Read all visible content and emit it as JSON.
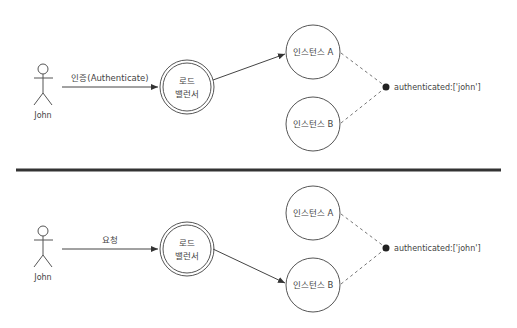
{
  "colors": {
    "stroke": "#555555",
    "text": "#444444",
    "divider": "#333333",
    "dash": "#777777",
    "dot": "#222222"
  },
  "top_panel": {
    "actor": {
      "label": "John"
    },
    "arrow_label": "인증(Authenticate)",
    "load_balancer": {
      "line1": "로드",
      "line2": "밸런서"
    },
    "instance_a": {
      "label": "인스턴스 A"
    },
    "instance_b": {
      "label": "인스턴스 B"
    },
    "session_store": {
      "label": "authenticated:['john']"
    },
    "routed_to": "instance_a"
  },
  "bottom_panel": {
    "actor": {
      "label": "John"
    },
    "arrow_label": "요청",
    "load_balancer": {
      "line1": "로드",
      "line2": "밸런서"
    },
    "instance_a": {
      "label": "인스턴스 A"
    },
    "instance_b": {
      "label": "인스턴스 B"
    },
    "session_store": {
      "label": "authenticated:['john']"
    },
    "routed_to": "instance_b"
  }
}
